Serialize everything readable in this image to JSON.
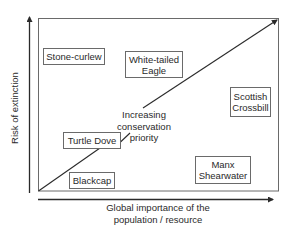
{
  "diagram": {
    "title": "",
    "axes": {
      "y": {
        "label": "Risk of extinction",
        "direction": "up"
      },
      "x": {
        "label_line1": "Global importance of the",
        "label_line2": "population / resource",
        "direction": "right"
      }
    },
    "diagonal_arrow": {
      "label_line1": "Increasing",
      "label_line2": "conservation",
      "label_line3": "priority",
      "direction": "bottom-left to top-right"
    },
    "species": [
      {
        "id": "stone-curlew",
        "line1": "Stone-curlew",
        "line2": "",
        "quadrant": "high risk, low importance"
      },
      {
        "id": "white-tailed-eagle",
        "line1": "White-tailed",
        "line2": "Eagle",
        "quadrant": "high risk, medium importance"
      },
      {
        "id": "scottish-crossbill",
        "line1": "Scottish",
        "line2": "Crossbill",
        "quadrant": "medium risk, high importance"
      },
      {
        "id": "turtle-dove",
        "line1": "Turtle Dove",
        "line2": "",
        "quadrant": "medium-low risk, low importance"
      },
      {
        "id": "blackcap",
        "line1": "Blackcap",
        "line2": "",
        "quadrant": "low risk, low importance"
      },
      {
        "id": "manx-shearwater",
        "line1": "Manx",
        "line2": "Shearwater",
        "quadrant": "low risk, high importance"
      }
    ],
    "colors": {
      "line": "#2a2a2a",
      "box_border": "#6a6a6a",
      "text": "#2a2a2a",
      "background": "#ffffff"
    }
  }
}
